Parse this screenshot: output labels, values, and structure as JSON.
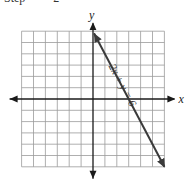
{
  "caption": {
    "step_label": "Step",
    "step_number": "2"
  },
  "chart_data": {
    "type": "line",
    "title": "",
    "xlabel": "x",
    "ylabel": "y",
    "xlim": [
      -6,
      6
    ],
    "ylim": [
      -6,
      6
    ],
    "grid": true,
    "tick_labels_shown": false,
    "series": [
      {
        "name": "2x + y = 6",
        "equation": "2x + y = 6",
        "slope": -2,
        "y_intercept": 6,
        "x_intercept": 3,
        "x": [
          0,
          6
        ],
        "y": [
          6,
          -6
        ],
        "arrows": "both",
        "color": "#3a3a3a"
      }
    ],
    "annotations": [
      {
        "text": "2x + y = 6",
        "placement": "along-line-upper-right"
      }
    ]
  }
}
